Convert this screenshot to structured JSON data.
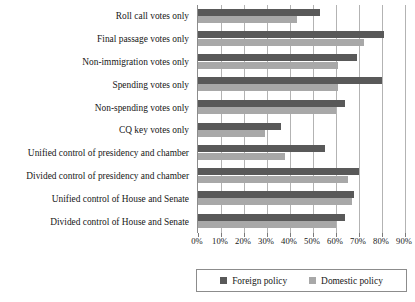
{
  "chart_data": {
    "type": "bar",
    "orientation": "horizontal",
    "title": "",
    "xlabel": "",
    "ylabel": "",
    "xlim": [
      0,
      90
    ],
    "grid": true,
    "legend_position": "bottom",
    "xticks": [
      "0%",
      "10%",
      "20%",
      "30%",
      "40%",
      "50%",
      "60%",
      "70%",
      "80%",
      "90%"
    ],
    "xtick_values": [
      0,
      10,
      20,
      30,
      40,
      50,
      60,
      70,
      80,
      90
    ],
    "categories": [
      "Roll call votes only",
      "Final passage votes only",
      "Non-immigration votes only",
      "Spending votes only",
      "Non-spending votes only",
      "CQ key votes only",
      "Unified control of presidency and chamber",
      "Divided control of presidency and chamber",
      "Unified control of House and Senate",
      "Divided control of House and Senate"
    ],
    "series": [
      {
        "name": "Foreign policy",
        "color": "#595959",
        "values": [
          53,
          81,
          69,
          80,
          64,
          36,
          55,
          70,
          68,
          64
        ]
      },
      {
        "name": "Domestic policy",
        "color": "#a8a8a8",
        "values": [
          43,
          72,
          61,
          61,
          60,
          29,
          38,
          65,
          67,
          60
        ]
      }
    ]
  },
  "legend": {
    "items": [
      {
        "label": "Foreign policy",
        "swatch": "foreign"
      },
      {
        "label": "Domestic policy",
        "swatch": "domestic"
      }
    ]
  }
}
